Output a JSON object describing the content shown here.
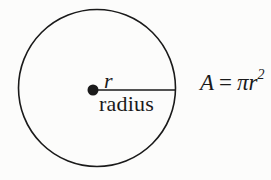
{
  "figure": {
    "background_color": "#fcfcfb",
    "ink_color": "#1a1a1a",
    "labels": {
      "radius_symbol": "r",
      "radius_word": "radius"
    },
    "formula": {
      "lhs": "A",
      "equals": "=",
      "rhs_base": "πr",
      "rhs_exponent": "2",
      "plain_text": "A = πr²"
    }
  }
}
